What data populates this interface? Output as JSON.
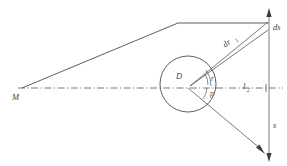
{
  "figure": {
    "title": "Geometric ray diagram with source M, circle D and screen segment ds",
    "background_color": "#ffffff",
    "line_color": "#4a4a52",
    "axis_color": "#6a6a72",
    "screen_color": "#8a8a92",
    "labels": {
      "source_point": "M",
      "circle_center": "D",
      "axis": "l",
      "axis_subscript": "2",
      "angle_upper": "r",
      "angle_lower": "p",
      "radial_element": "dr",
      "radial_element_subscript": "1",
      "screen_element": "ds",
      "screen_segment": "s"
    }
  },
  "geometry": {
    "source": {
      "x": 22,
      "y": 88
    },
    "circle": {
      "cx": 188,
      "cy": 84,
      "r": 28
    },
    "axis_line": {
      "x1": 18,
      "y1": 88,
      "x2": 283,
      "y2": 88
    },
    "screen_line": {
      "x": 269,
      "y_top": 10,
      "y_bottom": 160
    },
    "upper_fold": {
      "x": 178,
      "y": 23
    },
    "ray_top_end": {
      "x": 269,
      "y": 23
    },
    "ray_dr_end": {
      "x": 269,
      "y": 30
    },
    "ray_bottom_end": {
      "x": 262,
      "y": 152
    }
  }
}
